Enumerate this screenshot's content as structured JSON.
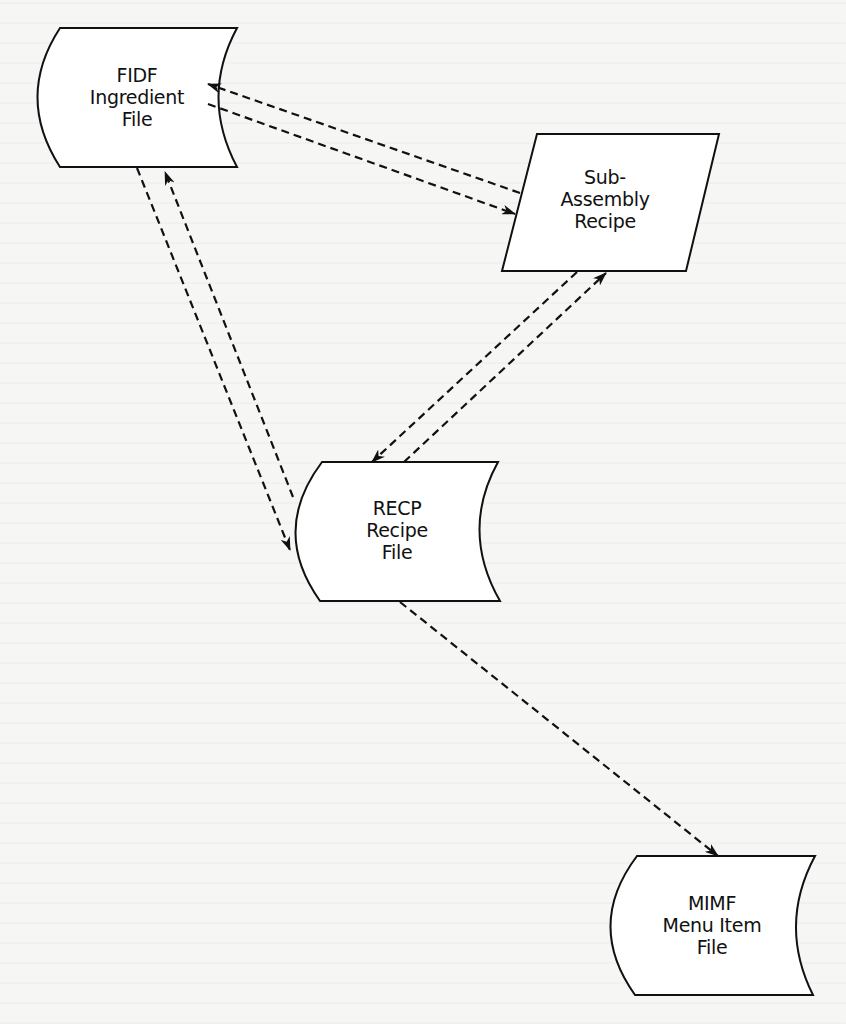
{
  "diagram": {
    "type": "data-flow",
    "colors": {
      "line": "#111111",
      "fill": "#ffffff",
      "background": "#f6f6f4"
    },
    "nodes": [
      {
        "id": "fidf",
        "shape": "stored-data",
        "lines": [
          "FIDF",
          "Ingredient",
          "File"
        ]
      },
      {
        "id": "subassembly",
        "shape": "parallelogram",
        "lines": [
          "Sub-",
          "Assembly",
          "Recipe"
        ]
      },
      {
        "id": "recp",
        "shape": "stored-data",
        "lines": [
          "RECP",
          "Recipe",
          "File"
        ]
      },
      {
        "id": "mimf",
        "shape": "stored-data",
        "lines": [
          "MIMF",
          "Menu Item",
          "File"
        ]
      }
    ],
    "edges": [
      {
        "from": "subassembly",
        "to": "fidf",
        "style": "dashed"
      },
      {
        "from": "fidf",
        "to": "subassembly",
        "style": "dashed"
      },
      {
        "from": "fidf",
        "to": "recp",
        "style": "dashed"
      },
      {
        "from": "recp",
        "to": "fidf",
        "style": "dashed"
      },
      {
        "from": "subassembly",
        "to": "recp",
        "style": "dashed"
      },
      {
        "from": "recp",
        "to": "subassembly",
        "style": "dashed"
      },
      {
        "from": "recp",
        "to": "mimf",
        "style": "dashed"
      }
    ]
  }
}
